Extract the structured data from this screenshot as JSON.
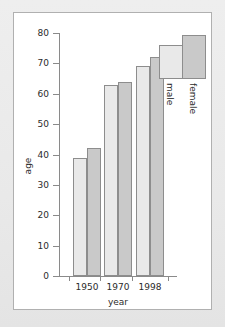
{
  "chart_data": {
    "type": "bar",
    "title": "",
    "xlabel": "year",
    "ylabel": "age",
    "categories": [
      "1950",
      "1970",
      "1998"
    ],
    "series": [
      {
        "name": "male",
        "values": [
          39,
          63,
          69
        ],
        "color": "#e9e9e9"
      },
      {
        "name": "female",
        "values": [
          42,
          64,
          72
        ],
        "color": "#c9c9c9"
      }
    ],
    "ylim": [
      0,
      80
    ],
    "ytick_labels": [
      "0",
      "10",
      "20",
      "30",
      "40",
      "50",
      "60",
      "70",
      "80"
    ],
    "ytick_values": [
      0,
      10,
      20,
      30,
      40,
      50,
      60,
      70,
      80
    ],
    "xtick_labels": [
      "1950",
      "1970",
      "1998"
    ],
    "grid": false,
    "legend": {
      "position": "top-right",
      "entries": [
        {
          "label": "male",
          "color": "#e9e9e9",
          "swatch_value": 78
        },
        {
          "label": "female",
          "color": "#c9c9c9",
          "swatch_value": 81
        }
      ]
    },
    "axis_color": "#8a8a8a",
    "bar_edge_color": "#8d8d8d",
    "panel_background": "#ffffff",
    "page_background": "#ebebeb"
  }
}
